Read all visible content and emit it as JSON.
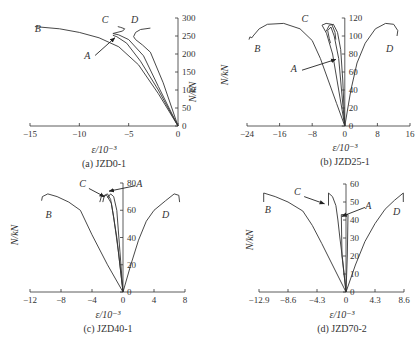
{
  "figure": {
    "panels": [
      {
        "id": "a",
        "caption": "(a) JZD0-1"
      },
      {
        "id": "b",
        "caption": "(b) JZD25-1"
      },
      {
        "id": "c",
        "caption": "(c) JZD40-1"
      },
      {
        "id": "d",
        "caption": "(d) JZD70-2"
      }
    ]
  },
  "chart_data": [
    {
      "type": "line",
      "title": "(a) JZD0-1",
      "xlabel": "ε/10⁻³",
      "ylabel": "N/kN",
      "xlim": [
        -15,
        0
      ],
      "ylim": [
        0,
        300
      ],
      "xticks": [
        -15,
        -10,
        -5,
        0
      ],
      "yticks": [
        0,
        50,
        100,
        150,
        200,
        250,
        300
      ],
      "grid": false,
      "layout": {
        "x0": 30,
        "x1": 178,
        "xv0": -15,
        "xv1": 0,
        "y0": 126,
        "y1": 18,
        "yv0": 0,
        "yv1": 300
      },
      "series": [
        {
          "name": "B",
          "points": [
            [
              0,
              0
            ],
            [
              -2,
              90
            ],
            [
              -4,
              170
            ],
            [
              -6,
              220
            ],
            [
              -8,
              245
            ],
            [
              -10,
              260
            ],
            [
              -12,
              270
            ],
            [
              -14.5,
              276
            ]
          ]
        },
        {
          "name": "A",
          "points": [
            [
              0,
              0
            ],
            [
              -2,
              100
            ],
            [
              -3.8,
              180
            ],
            [
              -5.2,
              230
            ],
            [
              -6.2,
              248
            ],
            [
              -6.6,
              252
            ]
          ]
        },
        {
          "name": "C",
          "points": [
            [
              0,
              0
            ],
            [
              -2,
              110
            ],
            [
              -3.5,
              195
            ],
            [
              -5,
              240
            ],
            [
              -6,
              253
            ],
            [
              -6.6,
              257
            ],
            [
              -5.6,
              264
            ],
            [
              -5.4,
              270
            ],
            [
              -5.8,
              274
            ],
            [
              -6.1,
              276
            ]
          ]
        },
        {
          "name": "D",
          "points": [
            [
              0,
              0
            ],
            [
              -1.5,
              120
            ],
            [
              -2.8,
              205
            ],
            [
              -3.6,
              225
            ],
            [
              -4.3,
              240
            ],
            [
              -4.5,
              248
            ],
            [
              -4.3,
              260
            ],
            [
              -3.8,
              268
            ],
            [
              -2.8,
              272
            ]
          ]
        }
      ],
      "labels": [
        {
          "text": "B",
          "x": -14.2,
          "y": 262
        },
        {
          "text": "C",
          "x": -7.4,
          "y": 287
        },
        {
          "text": "D",
          "x": -4.4,
          "y": 286
        },
        {
          "text": "A",
          "x": -9.2,
          "y": 185
        }
      ],
      "annotations": [
        {
          "label": "A",
          "arrow_from": [
            -8.4,
            196
          ],
          "arrow_to": [
            -6.4,
            245
          ]
        }
      ]
    },
    {
      "type": "line",
      "title": "(b) JZD25-1",
      "xlabel": "ε/10⁻³",
      "ylabel": "N/kN",
      "xlim": [
        -24,
        16
      ],
      "ylim": [
        0,
        120
      ],
      "xticks": [
        -24,
        -16,
        -8,
        0,
        8,
        16
      ],
      "yticks": [
        0,
        20,
        40,
        60,
        80,
        100,
        120
      ],
      "grid": false,
      "layout": {
        "x0": 247,
        "x1": 410,
        "xv0": -24,
        "xv1": 16,
        "y0": 126,
        "y1": 18,
        "yv0": 0,
        "yv1": 120
      },
      "series": [
        {
          "name": "B",
          "points": [
            [
              0,
              0
            ],
            [
              -2,
              25
            ],
            [
              -4,
              50
            ],
            [
              -6,
              75
            ],
            [
              -8,
              95
            ],
            [
              -11,
              108
            ],
            [
              -15,
              114
            ],
            [
              -19,
              113
            ],
            [
              -21,
              108
            ],
            [
              -22.5,
              100
            ],
            [
              -22.8,
              98
            ],
            [
              -23.3,
              99
            ],
            [
              -23.5,
              96
            ]
          ]
        },
        {
          "name": "C",
          "points": [
            [
              0,
              0
            ],
            [
              -1.5,
              40
            ],
            [
              -3,
              80
            ],
            [
              -4.5,
              103
            ],
            [
              -5.6,
              112
            ],
            [
              -4.6,
              114
            ],
            [
              -3.2,
              113
            ],
            [
              -2.4,
              104
            ],
            [
              -2.2,
              96
            ]
          ]
        },
        {
          "name": "A",
          "points": [
            [
              0,
              0
            ],
            [
              -0.8,
              40
            ],
            [
              -1.5,
              75
            ],
            [
              -2.6,
              100
            ],
            [
              -3.4,
              110
            ],
            [
              -4.2,
              106
            ],
            [
              -3.8,
              97
            ],
            [
              -3.5,
              92
            ]
          ]
        },
        {
          "name": "A2",
          "points": [
            [
              0,
              0
            ],
            [
              -0.5,
              50
            ],
            [
              -1,
              85
            ],
            [
              -1.8,
              104
            ],
            [
              -2.8,
              113
            ],
            [
              -3.8,
              112
            ],
            [
              -4.6,
              105
            ]
          ]
        },
        {
          "name": "D",
          "points": [
            [
              0,
              0
            ],
            [
              1.5,
              40
            ],
            [
              3,
              70
            ],
            [
              5,
              92
            ],
            [
              7.5,
              108
            ],
            [
              10,
              114
            ],
            [
              12,
              113
            ],
            [
              13,
              106
            ],
            [
              12.8,
              100
            ]
          ]
        }
      ],
      "labels": [
        {
          "text": "B",
          "x": -21.5,
          "y": 82
        },
        {
          "text": "C",
          "x": -9.8,
          "y": 116
        },
        {
          "text": "D",
          "x": 11,
          "y": 82
        },
        {
          "text": "A",
          "x": -12.5,
          "y": 60
        }
      ],
      "annotations": [
        {
          "label": "A",
          "arrow_from": [
            -10.5,
            62
          ],
          "arrow_to": [
            -2.2,
            74
          ]
        }
      ]
    },
    {
      "type": "line",
      "title": "(c) JZD40-1",
      "xlabel": "ε/10⁻³",
      "ylabel": "N/kN",
      "xlim": [
        -12,
        8
      ],
      "ylim": [
        0,
        80
      ],
      "xticks": [
        -12,
        -8,
        -4,
        0,
        4,
        8
      ],
      "yticks": [
        0,
        20,
        40,
        60,
        80
      ],
      "grid": false,
      "layout": {
        "x0": 30,
        "x1": 185,
        "xv0": -12,
        "xv1": 8,
        "y0": 292,
        "y1": 183,
        "yv0": 0,
        "yv1": 80
      },
      "series": [
        {
          "name": "B",
          "points": [
            [
              0,
              0
            ],
            [
              -2,
              20
            ],
            [
              -4,
              42
            ],
            [
              -5.5,
              60
            ],
            [
              -7,
              66
            ],
            [
              -8.5,
              70
            ],
            [
              -9.7,
              72
            ],
            [
              -10.4,
              70
            ],
            [
              -10.5,
              67
            ]
          ]
        },
        {
          "name": "C",
          "points": [
            [
              0,
              0
            ],
            [
              -0.6,
              30
            ],
            [
              -1.2,
              55
            ],
            [
              -1.6,
              68
            ],
            [
              -2,
              72
            ],
            [
              -2.4,
              71
            ],
            [
              -2.6,
              66
            ]
          ]
        },
        {
          "name": "C2",
          "points": [
            [
              0,
              0
            ],
            [
              -0.8,
              40
            ],
            [
              -1.5,
              65
            ],
            [
              -2.1,
              71
            ],
            [
              -2.8,
              70
            ],
            [
              -3,
              66
            ]
          ]
        },
        {
          "name": "A",
          "points": [
            [
              0,
              0
            ],
            [
              -0.4,
              30
            ],
            [
              -0.8,
              60
            ],
            [
              -1.2,
              70
            ],
            [
              -1.6,
              72
            ],
            [
              -2,
              69
            ]
          ]
        },
        {
          "name": "D",
          "points": [
            [
              0,
              0
            ],
            [
              1,
              20
            ],
            [
              2,
              38
            ],
            [
              3,
              52
            ],
            [
              4,
              60
            ],
            [
              5.5,
              67
            ],
            [
              6.6,
              72
            ],
            [
              7.2,
              71
            ],
            [
              7.3,
              66
            ]
          ]
        }
      ],
      "labels": [
        {
          "text": "B",
          "x": -9.6,
          "y": 54
        },
        {
          "text": "C",
          "x": -5.2,
          "y": 77
        },
        {
          "text": "A",
          "x": 2.1,
          "y": 77
        },
        {
          "text": "D",
          "x": 5.5,
          "y": 54
        }
      ],
      "annotations": [
        {
          "label": "C",
          "arrow_from": [
            -4.4,
            76
          ],
          "arrow_to": [
            -2.4,
            70
          ]
        },
        {
          "label": "A",
          "arrow_from": [
            1.6,
            78
          ],
          "arrow_to": [
            -1.8,
            74
          ]
        }
      ]
    },
    {
      "type": "line",
      "title": "(d) JZD70-2",
      "xlabel": "ε/10⁻³",
      "ylabel": "N/kN",
      "xlim": [
        -12.9,
        8.6
      ],
      "ylim": [
        0,
        60
      ],
      "xticks": [
        -12.9,
        -8.6,
        -4.3,
        0,
        4.3,
        8.6
      ],
      "yticks": [
        0,
        10,
        20,
        30,
        40,
        50,
        60
      ],
      "grid": false,
      "layout": {
        "x0": 259,
        "x1": 404,
        "xv0": -12.9,
        "xv1": 8.6,
        "y0": 292,
        "y1": 184,
        "yv0": 0,
        "yv1": 60
      },
      "series": [
        {
          "name": "B",
          "points": [
            [
              0,
              0
            ],
            [
              -2,
              15
            ],
            [
              -3.6,
              27
            ],
            [
              -5,
              37
            ],
            [
              -6.4,
              45
            ],
            [
              -8.6,
              50
            ],
            [
              -10.5,
              53
            ],
            [
              -12.2,
              55
            ],
            [
              -12.2,
              50
            ]
          ]
        },
        {
          "name": "C",
          "points": [
            [
              0,
              0
            ],
            [
              -0.5,
              18
            ],
            [
              -0.9,
              30
            ],
            [
              -1.2,
              40
            ],
            [
              -1.5,
              48
            ],
            [
              -2,
              53
            ],
            [
              -2.6,
              55
            ],
            [
              -2.6,
              48
            ]
          ]
        },
        {
          "name": "A",
          "points": [
            [
              0,
              0
            ],
            [
              -0.6,
              20
            ],
            [
              -0.7,
              43
            ],
            [
              0.3,
              43
            ],
            [
              0.2,
              20
            ],
            [
              0,
              0
            ]
          ]
        },
        {
          "name": "D",
          "points": [
            [
              0,
              0
            ],
            [
              1.4,
              15
            ],
            [
              2.8,
              28
            ],
            [
              4.3,
              38
            ],
            [
              5.8,
              46
            ],
            [
              7.2,
              51
            ],
            [
              8.5,
              55
            ],
            [
              8.5,
              50
            ]
          ]
        }
      ],
      "labels": [
        {
          "text": "B",
          "x": -11.6,
          "y": 44
        },
        {
          "text": "C",
          "x": -7.2,
          "y": 54
        },
        {
          "text": "A",
          "x": 3.3,
          "y": 46
        },
        {
          "text": "D",
          "x": 7.5,
          "y": 43
        }
      ],
      "annotations": [
        {
          "label": "C",
          "arrow_from": [
            -6.2,
            53
          ],
          "arrow_to": [
            -3.2,
            49
          ]
        },
        {
          "label": "A",
          "arrow_from": [
            2.8,
            47
          ],
          "arrow_to": [
            -0.6,
            42
          ]
        }
      ]
    }
  ]
}
